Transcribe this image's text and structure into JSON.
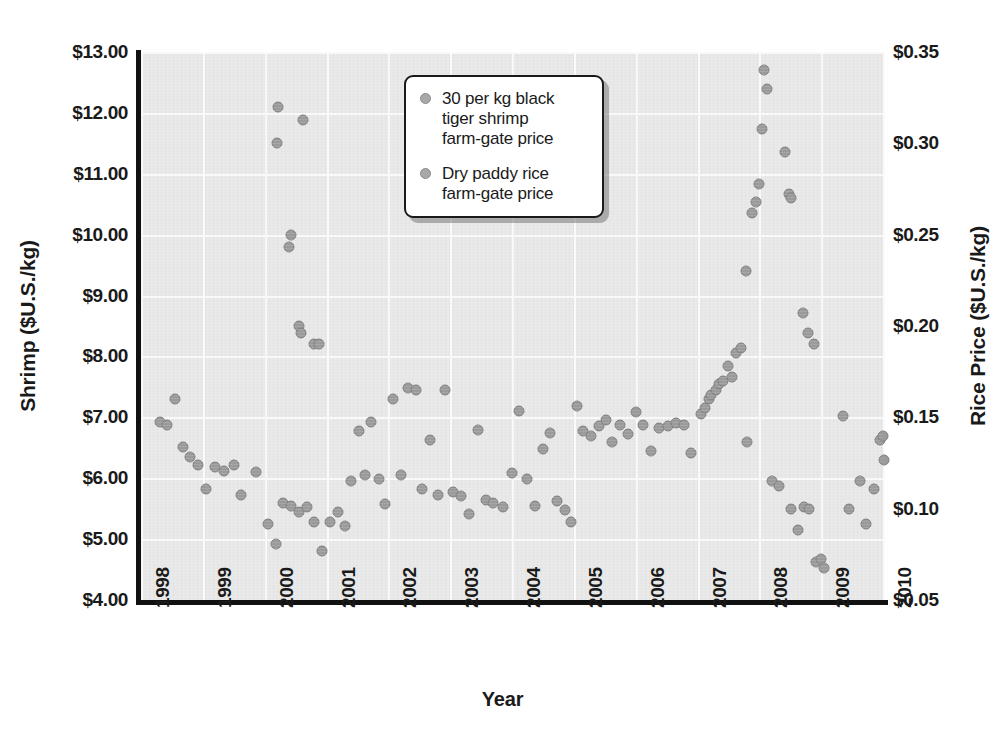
{
  "chart_data": {
    "type": "scatter",
    "title": "",
    "xlabel": "Year",
    "ylabel": "Shrimp ($U.S./kg)",
    "ylabel_right": "Rice Price ($U.S./kg)",
    "grid": true,
    "legend_position": "top-center",
    "xlim": [
      1998,
      2010
    ],
    "xticks": [
      "1998",
      "1999",
      "2000",
      "2001",
      "2002",
      "2003",
      "2004",
      "2005",
      "2006",
      "2007",
      "2008",
      "2009",
      "2010"
    ],
    "ylim_left": [
      4.0,
      13.0
    ],
    "yticks_left": [
      "$4.00",
      "$5.00",
      "$6.00",
      "$7.00",
      "$8.00",
      "$9.00",
      "$10.00",
      "$11.00",
      "$12.00",
      "$13.00"
    ],
    "ylim_right": [
      0.05,
      0.35
    ],
    "yticks_right": [
      "$0.05",
      "$0.10",
      "$0.15",
      "$0.20",
      "$0.25",
      "$0.30",
      "$0.35"
    ],
    "marker_color": "#9b9b9b",
    "plot_background": "#e8e8e8",
    "gridline_color": "#fafafa",
    "series": [
      {
        "name": "30 per kg black tiger shrimp farm-gate price",
        "axis": "left",
        "unit": "$U.S./kg",
        "points": [
          [
            1998.3,
            6.92
          ],
          [
            1998.42,
            6.88
          ],
          [
            1998.55,
            7.3
          ],
          [
            1998.68,
            6.52
          ],
          [
            1998.8,
            6.35
          ],
          [
            1998.92,
            6.22
          ],
          [
            1999.05,
            5.82
          ],
          [
            1999.2,
            6.18
          ],
          [
            1999.34,
            6.12
          ],
          [
            1999.5,
            6.22
          ],
          [
            1999.62,
            5.72
          ],
          [
            1999.86,
            6.1
          ],
          [
            2000.05,
            5.25
          ],
          [
            2000.18,
            4.92
          ],
          [
            2000.3,
            5.6
          ],
          [
            2000.42,
            5.55
          ],
          [
            2000.55,
            5.45
          ],
          [
            2000.68,
            5.52
          ],
          [
            2000.8,
            5.28
          ],
          [
            2000.92,
            4.8
          ],
          [
            2001.05,
            5.28
          ],
          [
            2001.18,
            5.45
          ],
          [
            2001.3,
            5.22
          ],
          [
            2001.4,
            5.95
          ],
          [
            2001.52,
            6.78
          ],
          [
            2001.62,
            6.05
          ],
          [
            2001.72,
            6.92
          ],
          [
            2001.85,
            5.98
          ],
          [
            2001.95,
            5.58
          ],
          [
            2002.08,
            7.3
          ],
          [
            2002.2,
            6.05
          ],
          [
            2002.32,
            7.48
          ],
          [
            2002.45,
            7.45
          ],
          [
            2002.55,
            5.82
          ],
          [
            2002.68,
            6.62
          ],
          [
            2002.8,
            5.72
          ],
          [
            2002.92,
            7.45
          ],
          [
            2003.05,
            5.78
          ],
          [
            2003.18,
            5.7
          ],
          [
            2003.3,
            5.42
          ],
          [
            2003.45,
            6.8
          ],
          [
            2003.58,
            5.65
          ],
          [
            2003.7,
            5.6
          ],
          [
            2003.85,
            5.52
          ],
          [
            2004.0,
            6.08
          ],
          [
            2004.12,
            7.1
          ],
          [
            2004.25,
            5.98
          ],
          [
            2004.38,
            5.55
          ],
          [
            2004.5,
            6.48
          ],
          [
            2004.62,
            6.75
          ],
          [
            2004.72,
            5.62
          ],
          [
            2004.85,
            5.48
          ],
          [
            2004.95,
            5.28
          ],
          [
            2005.05,
            7.18
          ],
          [
            2005.15,
            6.78
          ],
          [
            2005.28,
            6.7
          ],
          [
            2005.4,
            6.85
          ],
          [
            2005.52,
            6.95
          ],
          [
            2005.62,
            6.6
          ],
          [
            2005.75,
            6.88
          ],
          [
            2005.88,
            6.72
          ],
          [
            2006.0,
            7.08
          ],
          [
            2006.12,
            6.88
          ],
          [
            2006.25,
            6.45
          ],
          [
            2006.38,
            6.82
          ],
          [
            2006.52,
            6.85
          ],
          [
            2006.65,
            6.9
          ],
          [
            2006.78,
            6.88
          ],
          [
            2006.9,
            6.42
          ],
          [
            2007.8,
            6.6
          ],
          [
            2008.2,
            5.95
          ],
          [
            2008.32,
            5.88
          ],
          [
            2008.52,
            5.5
          ],
          [
            2008.62,
            5.15
          ],
          [
            2008.72,
            5.52
          ],
          [
            2008.8,
            5.5
          ],
          [
            2008.92,
            4.62
          ],
          [
            2009.0,
            4.68
          ],
          [
            2009.05,
            4.52
          ],
          [
            2009.35,
            7.02
          ],
          [
            2009.45,
            5.5
          ],
          [
            2009.62,
            5.95
          ],
          [
            2009.72,
            5.25
          ],
          [
            2009.85,
            5.82
          ],
          [
            2009.95,
            6.62
          ],
          [
            2010.0,
            6.7
          ],
          [
            2010.02,
            6.3
          ]
        ]
      },
      {
        "name": "Dry paddy rice farm-gate price",
        "axis": "right",
        "unit": "$U.S./kg",
        "points": [
          [
            2000.22,
            0.32
          ],
          [
            2000.2,
            0.3
          ],
          [
            2000.42,
            0.25
          ],
          [
            2000.4,
            0.243
          ],
          [
            2000.55,
            0.2
          ],
          [
            2000.58,
            0.196
          ],
          [
            2000.62,
            0.313
          ],
          [
            2000.8,
            0.19
          ],
          [
            2000.88,
            0.19
          ],
          [
            2007.05,
            0.152
          ],
          [
            2007.12,
            0.155
          ],
          [
            2007.18,
            0.16
          ],
          [
            2007.22,
            0.162
          ],
          [
            2007.3,
            0.165
          ],
          [
            2007.35,
            0.168
          ],
          [
            2007.42,
            0.17
          ],
          [
            2007.5,
            0.178
          ],
          [
            2007.55,
            0.172
          ],
          [
            2007.62,
            0.185
          ],
          [
            2007.7,
            0.188
          ],
          [
            2007.78,
            0.23
          ],
          [
            2007.88,
            0.262
          ],
          [
            2007.95,
            0.268
          ],
          [
            2008.0,
            0.278
          ],
          [
            2008.05,
            0.308
          ],
          [
            2008.08,
            0.34
          ],
          [
            2008.12,
            0.33
          ],
          [
            2008.42,
            0.295
          ],
          [
            2008.48,
            0.272
          ],
          [
            2008.52,
            0.27
          ],
          [
            2008.7,
            0.207
          ],
          [
            2008.78,
            0.196
          ],
          [
            2008.88,
            0.19
          ]
        ]
      }
    ]
  },
  "legend": {
    "items": [
      {
        "label": "30 per kg black\ntiger shrimp\nfarm-gate price"
      },
      {
        "label": "Dry paddy rice\nfarm-gate price"
      }
    ]
  }
}
